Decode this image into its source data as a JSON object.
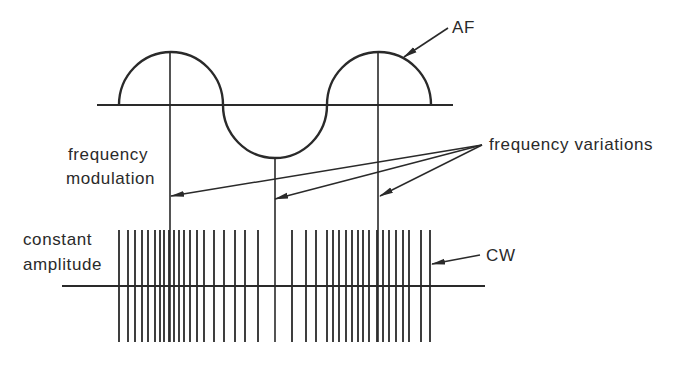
{
  "colors": {
    "ink": "#2a2a2a",
    "background": "#ffffff"
  },
  "labels": {
    "af": "AF",
    "frequency_variations": "frequency variations",
    "fm_line1": "frequency",
    "fm_line2": "modulation",
    "ca_line1": "constant",
    "ca_line2": "amplitude",
    "cw": "CW"
  },
  "waveform": {
    "baseline_y": 105,
    "baseline_x": [
      97,
      453
    ],
    "amplitude": 53,
    "half_cycles": [
      {
        "type": "positive",
        "x_start": 119,
        "x_end": 223
      },
      {
        "type": "negative",
        "x_start": 223,
        "x_end": 327
      },
      {
        "type": "positive",
        "x_start": 327,
        "x_end": 431
      }
    ],
    "markers_x": [
      170,
      275,
      378
    ]
  },
  "carrier": {
    "baseline_y": 286,
    "baseline_x": [
      62,
      485
    ],
    "line_top": 230,
    "line_bottom": 342,
    "lines_x": [
      119,
      128,
      135,
      142,
      148,
      155,
      160,
      164,
      169,
      174,
      179,
      184,
      190,
      197,
      204,
      214,
      224,
      235,
      245,
      258,
      292,
      306,
      316,
      327,
      333,
      339,
      346,
      352,
      358,
      363,
      369,
      377,
      383,
      389,
      396,
      403,
      409,
      421,
      430
    ]
  },
  "arrows": {
    "af": {
      "from": [
        448,
        28
      ],
      "to": [
        404,
        57
      ]
    },
    "fv_origin": [
      482,
      145
    ],
    "fv_targets": [
      [
        171,
        196
      ],
      [
        275,
        199
      ],
      [
        380,
        196
      ]
    ],
    "cw": {
      "from": [
        480,
        255
      ],
      "to": [
        432,
        264
      ]
    }
  }
}
